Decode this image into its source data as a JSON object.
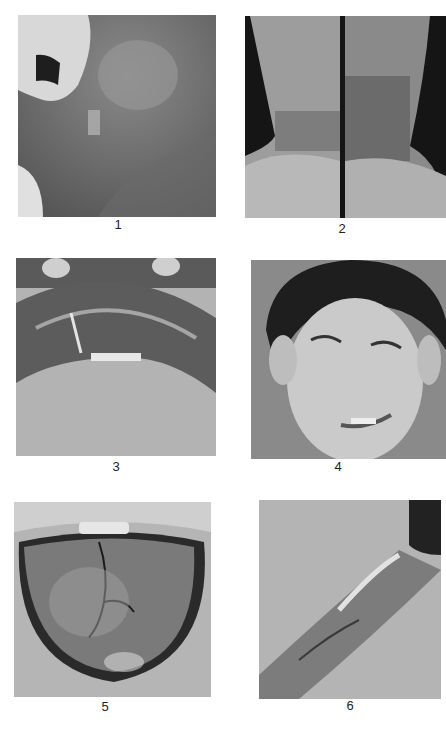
{
  "page": {
    "layout": "2-column x 3-row grid of clinical photographs",
    "background": "#ffffff"
  },
  "figures": [
    {
      "label": "1",
      "subject": "oral mucosa / inner cheek with teeth at upper left"
    },
    {
      "label": "2",
      "subject": "two forearms and wrists with pigmented rough skin"
    },
    {
      "label": "3",
      "subject": "swollen shiny lower lip with fissure, chin below"
    },
    {
      "label": "4",
      "subject": "boy's face with freckles, squinting"
    },
    {
      "label": "5",
      "subject": "fissured tongue in open mouth"
    },
    {
      "label": "6",
      "subject": "skin fold with crusted lesion"
    }
  ]
}
